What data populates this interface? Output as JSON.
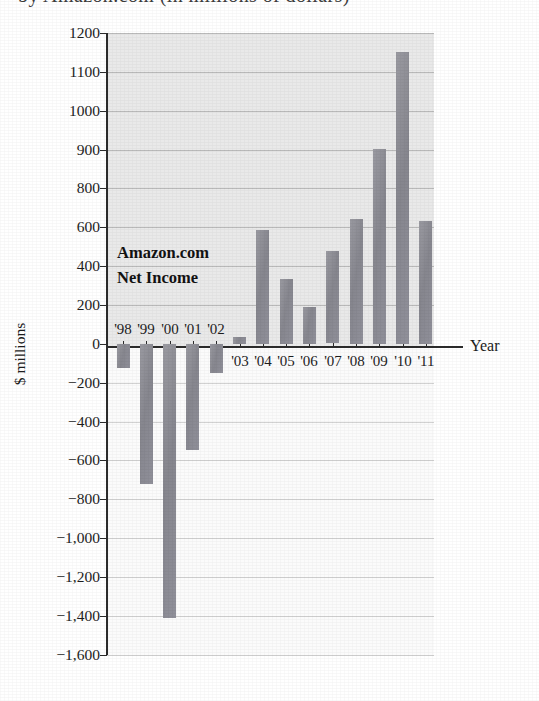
{
  "figure": {
    "cropped_title_line": "by Amazon.com (in millions of dollars)",
    "annotation_line_1": "Amazon.com",
    "annotation_line_2": "Net Income",
    "y_axis_title": "$ millions",
    "x_axis_title": "Year"
  },
  "colors": {
    "bar": "#8d8d95",
    "panel": "#e9e9e9",
    "gridline": "#b9b9b9",
    "axis": "#2b2b2b",
    "text": "#1d1d1d"
  },
  "chart_data": {
    "type": "bar",
    "title": "Amazon.com Net Income",
    "xlabel": "Year",
    "ylabel": "$ millions",
    "grid": true,
    "legend": "none",
    "ylim": [
      -1600,
      1200
    ],
    "categories": [
      "'98",
      "'99",
      "'00",
      "'01",
      "'02",
      "'03",
      "'04",
      "'05",
      "'06",
      "'07",
      "'08",
      "'09",
      "'10",
      "'11"
    ],
    "values": [
      -125,
      -720,
      -1411,
      -545,
      -149,
      35,
      588,
      333,
      190,
      476,
      645,
      902,
      1152,
      631
    ],
    "ytick_labels": [
      "1200",
      "1100",
      "1000",
      "900",
      "800",
      "600",
      "400",
      "200",
      "0",
      "−200",
      "−400",
      "−600",
      "−800",
      "−1,000",
      "−1,200",
      "−1,400",
      "−1,600"
    ],
    "ytick_values": [
      1200,
      1100,
      1000,
      900,
      800,
      600,
      400,
      200,
      0,
      -200,
      -400,
      -600,
      -800,
      -1000,
      -1200,
      -1400,
      -1600
    ],
    "xtick_labels_above_axis": [
      "'98",
      "'99",
      "'00",
      "'01",
      "'02"
    ],
    "xtick_labels_below_axis": [
      "'03",
      "'04",
      "'05",
      "'06",
      "'07",
      "'08",
      "'09",
      "'10",
      "'11"
    ],
    "annotations": [
      "Amazon.com",
      "Net Income"
    ]
  }
}
